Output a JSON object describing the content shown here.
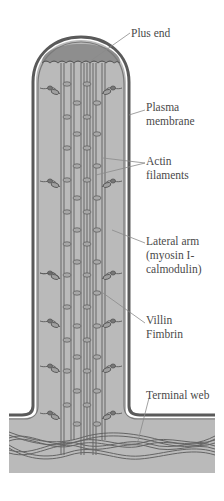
{
  "labels": {
    "plus_end": "Plus end",
    "plasma_membrane_1": "Plasma",
    "plasma_membrane_2": "membrane",
    "actin_1": "Actin",
    "actin_2": "filaments",
    "lateral_arm_1": "Lateral arm",
    "lateral_arm_2": "(myosin I-",
    "lateral_arm_3": "calmodulin)",
    "villin": "Villin",
    "fimbrin": "Fimbrin",
    "terminal_web": "Terminal web"
  },
  "colors": {
    "cytoplasm": "#b9b9b9",
    "cap": "#8c8c8c",
    "membrane": "#5a5a5a",
    "filament": "#6a6a6a",
    "crosslink": "#a3a3a3",
    "leader": "#8a8a8a",
    "text": "#4a4a4a"
  }
}
